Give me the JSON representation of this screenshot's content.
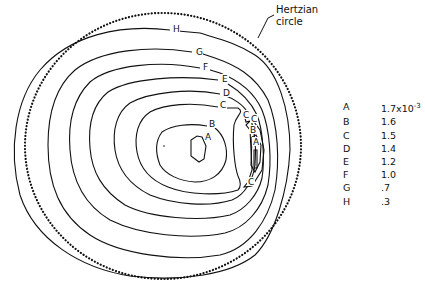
{
  "callout": {
    "line1": "Hertzian",
    "line2": "circle"
  },
  "legend": [
    {
      "key": "A",
      "value": "1.7x10",
      "exp": "-3"
    },
    {
      "key": "B",
      "value": "1.6",
      "exp": ""
    },
    {
      "key": "C",
      "value": "1.5",
      "exp": ""
    },
    {
      "key": "D",
      "value": "1.4",
      "exp": ""
    },
    {
      "key": "E",
      "value": "1.2",
      "exp": ""
    },
    {
      "key": "F",
      "value": "1.0",
      "exp": ""
    },
    {
      "key": "G",
      "value": ".7",
      "exp": ""
    },
    {
      "key": "H",
      "value": ".3",
      "exp": ""
    }
  ],
  "contour_labels": [
    {
      "text": "H",
      "x": 173,
      "y": 32
    },
    {
      "text": "G",
      "x": 196,
      "y": 55
    },
    {
      "text": "F",
      "x": 203,
      "y": 70
    },
    {
      "text": "E",
      "x": 222,
      "y": 82
    },
    {
      "text": "D",
      "x": 223,
      "y": 96
    },
    {
      "text": "C",
      "x": 220,
      "y": 108
    },
    {
      "text": "B",
      "x": 209,
      "y": 127
    },
    {
      "text": "A",
      "x": 205,
      "y": 140
    },
    {
      "text": "C",
      "x": 243,
      "y": 118
    },
    {
      "text": "C",
      "x": 251,
      "y": 122
    },
    {
      "text": "B",
      "x": 250,
      "y": 133
    },
    {
      "text": "A",
      "x": 253,
      "y": 145
    },
    {
      "text": "C",
      "x": 248,
      "y": 185
    }
  ]
}
